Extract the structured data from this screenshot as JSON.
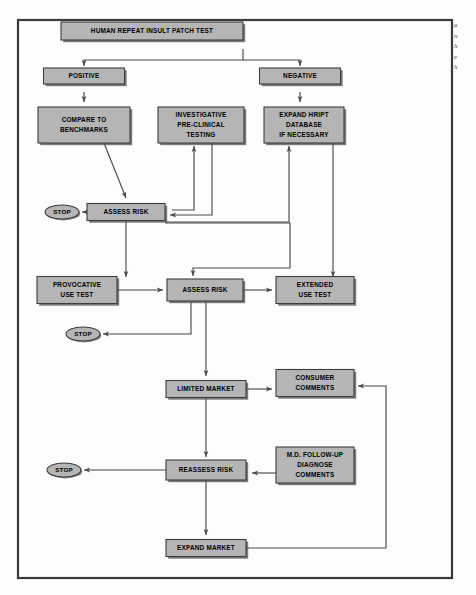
{
  "figure": {
    "frame_color": "#3a3a3a",
    "box_fill": "#b5b5b5",
    "box_stroke": "#3d3d3d",
    "box_shadow": "#5a5a5a",
    "line_color": "#4a4a4a",
    "text_color": "#000000",
    "background": "#fdfdfc"
  },
  "side_note": {
    "lines": [
      "a",
      "n",
      "h",
      "e",
      "h"
    ]
  },
  "nodes": {
    "hript": {
      "label": "HUMAN REPEAT INSULT PATCH TEST",
      "x": 152,
      "y": 31,
      "w": 182,
      "h": 18,
      "font": 6.4,
      "shape": "rect"
    },
    "positive": {
      "label": "POSITIVE",
      "x": 84,
      "y": 76,
      "w": 81,
      "h": 16,
      "font": 6.4,
      "shape": "rect"
    },
    "negative": {
      "label": "NEGATIVE",
      "x": 300,
      "y": 76,
      "w": 81,
      "h": 16,
      "font": 6.4,
      "shape": "rect"
    },
    "compare": {
      "label": "COMPARE TO|BENCHMARKS",
      "x": 84,
      "y": 125,
      "w": 92,
      "h": 36,
      "font": 6.4,
      "shape": "rect"
    },
    "investigative": {
      "label": "INVESTIGATIVE|PRE-CLINICAL|TESTING",
      "x": 201,
      "y": 125,
      "w": 86,
      "h": 36,
      "font": 6.4,
      "shape": "rect"
    },
    "expand_hript": {
      "label": "EXPAND HRIPT|DATABASE|IF NECESSARY",
      "x": 304,
      "y": 125,
      "w": 80,
      "h": 36,
      "font": 6.4,
      "shape": "rect"
    },
    "assess1": {
      "label": "ASSESS RISK",
      "x": 126,
      "y": 212,
      "w": 78,
      "h": 17,
      "font": 6.4,
      "shape": "rect"
    },
    "stop1": {
      "label": "STOP",
      "x": 62,
      "y": 212,
      "w": 34,
      "h": 14,
      "font": 6.2,
      "shape": "ellipse"
    },
    "provocative": {
      "label": "PROVOCATIVE|USE TEST",
      "x": 77,
      "y": 290,
      "w": 80,
      "h": 27,
      "font": 6.4,
      "shape": "rect"
    },
    "assess2": {
      "label": "ASSESS RISK",
      "x": 205,
      "y": 290,
      "w": 76,
      "h": 22,
      "font": 6.4,
      "shape": "rect"
    },
    "extended": {
      "label": "EXTENDED|USE TEST",
      "x": 315,
      "y": 290,
      "w": 78,
      "h": 27,
      "font": 6.4,
      "shape": "rect"
    },
    "stop2": {
      "label": "STOP",
      "x": 83,
      "y": 334,
      "w": 34,
      "h": 14,
      "font": 6.2,
      "shape": "ellipse"
    },
    "limited": {
      "label": "LIMITED MARKET",
      "x": 206,
      "y": 389,
      "w": 80,
      "h": 17,
      "font": 6.4,
      "shape": "rect"
    },
    "consumer": {
      "label": "CONSUMER|COMMENTS",
      "x": 315,
      "y": 383,
      "w": 78,
      "h": 27,
      "font": 6.4,
      "shape": "rect"
    },
    "reassess": {
      "label": "REASSESS RISK",
      "x": 206,
      "y": 470,
      "w": 80,
      "h": 20,
      "font": 6.4,
      "shape": "rect"
    },
    "md": {
      "label": "M.D. FOLLOW-UP|DIAGNOSE|COMMENTS",
      "x": 315,
      "y": 465,
      "w": 78,
      "h": 36,
      "font": 6.4,
      "shape": "rect"
    },
    "stop3": {
      "label": "STOP",
      "x": 64,
      "y": 470,
      "w": 34,
      "h": 14,
      "font": 6.2,
      "shape": "ellipse"
    },
    "expand_market": {
      "label": "EXPAND MARKET",
      "x": 206,
      "y": 548,
      "w": 80,
      "h": 17,
      "font": 6.4,
      "shape": "rect"
    }
  },
  "edges": [
    {
      "name": "hript-to-positive",
      "from": "hript",
      "to": "positive"
    },
    {
      "name": "hript-to-negative",
      "from": "hript",
      "to": "negative"
    },
    {
      "name": "positive-to-compare",
      "from": "positive",
      "to": "compare"
    },
    {
      "name": "negative-to-expand-hript",
      "from": "negative",
      "to": "expand_hript"
    },
    {
      "name": "compare-to-assess1",
      "from": "compare",
      "to": "assess1"
    },
    {
      "name": "investigative-to-assess1",
      "from": "investigative",
      "to": "assess1"
    },
    {
      "name": "assess1-to-investigative",
      "from": "assess1",
      "to": "investigative"
    },
    {
      "name": "assess1-to-stop1",
      "from": "assess1",
      "to": "stop1"
    },
    {
      "name": "assess1-to-expand-hript",
      "from": "assess1",
      "to": "expand_hript"
    },
    {
      "name": "assess1-to-provocative",
      "from": "assess1",
      "to": "provocative"
    },
    {
      "name": "assess1-to-assess2",
      "from": "assess1",
      "to": "assess2"
    },
    {
      "name": "expand-hript-to-extended",
      "from": "expand_hript",
      "to": "extended"
    },
    {
      "name": "provocative-to-assess2",
      "from": "provocative",
      "to": "assess2"
    },
    {
      "name": "assess2-to-extended",
      "from": "assess2",
      "to": "extended"
    },
    {
      "name": "assess2-to-stop2",
      "from": "assess2",
      "to": "stop2"
    },
    {
      "name": "assess2-to-limited",
      "from": "assess2",
      "to": "limited"
    },
    {
      "name": "limited-to-consumer",
      "from": "limited",
      "to": "consumer"
    },
    {
      "name": "limited-to-reassess",
      "from": "limited",
      "to": "reassess"
    },
    {
      "name": "md-to-reassess",
      "from": "md",
      "to": "reassess"
    },
    {
      "name": "reassess-to-stop3",
      "from": "reassess",
      "to": "stop3"
    },
    {
      "name": "reassess-to-expand-market",
      "from": "reassess",
      "to": "expand_market"
    },
    {
      "name": "expand-market-to-consumer",
      "from": "expand_market",
      "to": "consumer"
    }
  ]
}
